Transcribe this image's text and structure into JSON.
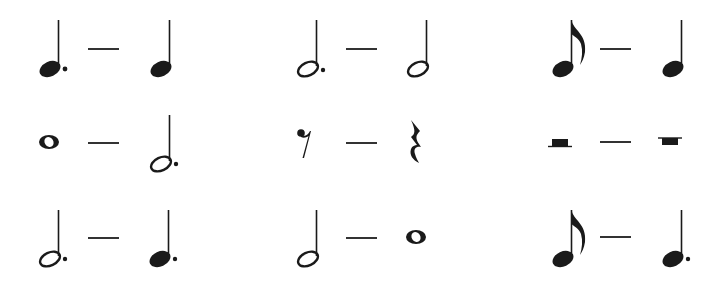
{
  "title": "Note and rest value equivalences",
  "ink_color": "#1a1a1a",
  "rows": [
    {
      "cells": [
        {
          "left": "dotted-quarter-note",
          "separator": "—",
          "right": "quarter-note",
          "label": "dotted quarter — quarter"
        },
        {
          "left": "dotted-half-note",
          "separator": "—",
          "right": "half-note",
          "label": "dotted half — half"
        },
        {
          "left": "eighth-note",
          "separator": "—",
          "right": "quarter-note",
          "label": "eighth — quarter"
        }
      ]
    },
    {
      "cells": [
        {
          "left": "whole-note",
          "separator": "—",
          "right": "dotted-half-note",
          "label": "whole — dotted half"
        },
        {
          "left": "eighth-rest",
          "separator": "—",
          "right": "quarter-rest",
          "label": "eighth rest — quarter rest"
        },
        {
          "left": "half-rest",
          "separator": "—",
          "right": "whole-rest",
          "label": "half rest — whole rest"
        }
      ]
    },
    {
      "cells": [
        {
          "left": "dotted-half-note",
          "separator": "—",
          "right": "dotted-quarter-note",
          "label": "dotted half — dotted quarter"
        },
        {
          "left": "half-note",
          "separator": "—",
          "right": "whole-note",
          "label": "half — whole"
        },
        {
          "left": "eighth-note",
          "separator": "—",
          "right": "dotted-quarter-note",
          "label": "eighth — dotted quarter"
        }
      ]
    }
  ]
}
